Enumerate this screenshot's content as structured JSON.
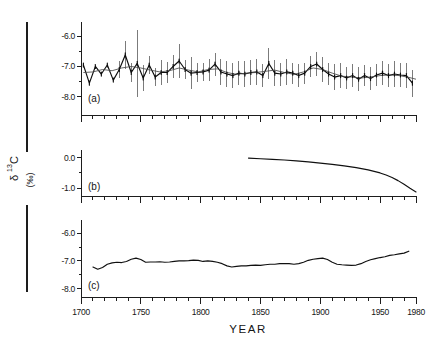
{
  "figure": {
    "y_axis_label": {
      "delta": "δ",
      "superscript": "13",
      "element": "C",
      "units": "(‰)"
    },
    "x_axis_title": "YEAR",
    "panels": [
      {
        "key": "a",
        "label": "(a)"
      },
      {
        "key": "b",
        "label": "(b)"
      },
      {
        "key": "c",
        "label": "(c)"
      }
    ]
  },
  "chart_data": [
    {
      "type": "line",
      "panel": "a",
      "title": "",
      "subtitle": "Measured tree-ring δ13C with 5-year means and error bars",
      "xlabel": "YEAR",
      "ylabel": "δ13C (‰)",
      "xlim": [
        1700,
        1980
      ],
      "ylim": [
        -8.6,
        -5.6
      ],
      "grid": false,
      "legend": "none",
      "xticks": [
        1700,
        1750,
        1800,
        1850,
        1900,
        1950,
        1980
      ],
      "xtick_labels": [
        "1700",
        "1750",
        "1800",
        "1850",
        "1900",
        "1950",
        "1980"
      ],
      "xminor_step": 10,
      "yticks": [
        -6.0,
        -7.0,
        -8.0
      ],
      "ytick_labels": [
        "-6.0",
        "-7.0",
        "-8.0"
      ],
      "yminor": [
        -6.5,
        -7.5
      ],
      "series": [
        {
          "name": "measured",
          "x": [
            1702,
            1707,
            1712,
            1717,
            1722,
            1727,
            1732,
            1737,
            1742,
            1747,
            1752,
            1757,
            1762,
            1767,
            1772,
            1777,
            1782,
            1787,
            1792,
            1797,
            1802,
            1807,
            1812,
            1817,
            1822,
            1827,
            1832,
            1837,
            1842,
            1847,
            1852,
            1857,
            1862,
            1867,
            1872,
            1877,
            1882,
            1887,
            1892,
            1897,
            1902,
            1907,
            1912,
            1917,
            1922,
            1927,
            1932,
            1937,
            1942,
            1947,
            1952,
            1957,
            1962,
            1967,
            1972,
            1977
          ],
          "values": [
            -6.95,
            -7.55,
            -7.0,
            -7.25,
            -6.95,
            -7.45,
            -7.1,
            -6.62,
            -7.2,
            -6.9,
            -7.38,
            -6.95,
            -7.35,
            -7.2,
            -7.2,
            -7.0,
            -6.82,
            -7.1,
            -7.22,
            -7.2,
            -7.18,
            -7.12,
            -6.92,
            -7.18,
            -7.25,
            -7.3,
            -7.22,
            -7.25,
            -7.2,
            -7.18,
            -7.3,
            -6.9,
            -7.22,
            -7.25,
            -7.18,
            -7.22,
            -7.3,
            -7.22,
            -7.0,
            -6.92,
            -7.1,
            -7.25,
            -7.35,
            -7.3,
            -7.38,
            -7.3,
            -7.42,
            -7.3,
            -7.4,
            -7.28,
            -7.22,
            -7.3,
            -7.25,
            -7.28,
            -7.3,
            -7.55
          ],
          "errors": [
            0.0,
            0.0,
            0.0,
            0.0,
            0.0,
            0.0,
            0.28,
            0.45,
            0.3,
            1.1,
            0.42,
            0.3,
            0.3,
            0.42,
            0.35,
            0.38,
            0.55,
            0.3,
            0.52,
            0.3,
            0.3,
            0.35,
            0.38,
            0.42,
            0.42,
            0.4,
            0.4,
            0.42,
            0.4,
            0.42,
            0.38,
            0.5,
            0.42,
            0.38,
            0.42,
            0.35,
            0.38,
            0.35,
            0.35,
            0.4,
            0.42,
            0.35,
            0.42,
            0.4,
            0.35,
            0.38,
            0.4,
            0.35,
            0.38,
            0.35,
            0.4,
            0.38,
            0.42,
            0.4,
            0.42,
            0.45
          ]
        },
        {
          "name": "smoothed",
          "x": [
            1702,
            1710,
            1718,
            1726,
            1734,
            1742,
            1750,
            1758,
            1766,
            1774,
            1782,
            1790,
            1798,
            1806,
            1814,
            1822,
            1830,
            1838,
            1846,
            1854,
            1862,
            1870,
            1878,
            1886,
            1894,
            1902,
            1910,
            1918,
            1926,
            1934,
            1942,
            1950,
            1958,
            1966,
            1974,
            1980
          ],
          "values": [
            -7.2,
            -7.18,
            -7.1,
            -7.14,
            -7.05,
            -7.0,
            -7.05,
            -7.12,
            -7.18,
            -7.14,
            -7.05,
            -7.12,
            -7.18,
            -7.1,
            -7.08,
            -7.2,
            -7.26,
            -7.22,
            -7.2,
            -7.16,
            -7.12,
            -7.2,
            -7.26,
            -7.18,
            -7.05,
            -7.1,
            -7.22,
            -7.32,
            -7.35,
            -7.38,
            -7.35,
            -7.3,
            -7.28,
            -7.3,
            -7.36,
            -7.42
          ]
        }
      ]
    },
    {
      "type": "line",
      "panel": "b",
      "title": "",
      "subtitle": "Suess effect correction (fossil fuel CO2 dilution)",
      "xlabel": "YEAR",
      "ylabel": "δ13C (‰)",
      "xlim": [
        1700,
        1980
      ],
      "ylim": [
        -1.25,
        0.18
      ],
      "grid": false,
      "legend": "none",
      "xticks": [
        1700,
        1750,
        1800,
        1850,
        1900,
        1950,
        1980
      ],
      "xtick_labels": [
        "1700",
        "1750",
        "1800",
        "1850",
        "1900",
        "1950",
        "1980"
      ],
      "xminor_step": 10,
      "yticks": [
        0.0,
        -1.0
      ],
      "ytick_labels": [
        "0.0",
        "-1.0"
      ],
      "yminor": [
        -0.5
      ],
      "series": [
        {
          "name": "suess-correction",
          "x": [
            1840,
            1850,
            1860,
            1870,
            1880,
            1890,
            1900,
            1910,
            1920,
            1930,
            1940,
            1950,
            1955,
            1960,
            1965,
            1970,
            1975,
            1980
          ],
          "values": [
            -0.02,
            -0.04,
            -0.06,
            -0.08,
            -0.11,
            -0.14,
            -0.18,
            -0.22,
            -0.27,
            -0.33,
            -0.4,
            -0.5,
            -0.57,
            -0.65,
            -0.75,
            -0.87,
            -1.0,
            -1.12
          ]
        }
      ]
    },
    {
      "type": "line",
      "panel": "c",
      "title": "",
      "subtitle": "Corrected δ13C record (measured minus Suess effect), smoothed",
      "xlabel": "YEAR",
      "ylabel": "δ13C (‰)",
      "xlim": [
        1700,
        1980
      ],
      "ylim": [
        -8.3,
        -5.6
      ],
      "grid": false,
      "legend": "none",
      "xticks": [
        1700,
        1750,
        1800,
        1850,
        1900,
        1950,
        1980
      ],
      "xtick_labels": [
        "1700",
        "1750",
        "1800",
        "1850",
        "1900",
        "1950",
        "1980"
      ],
      "xminor_step": 10,
      "yticks": [
        -6.0,
        -7.0,
        -8.0
      ],
      "ytick_labels": [
        "-6.0",
        "-7.0",
        "-8.0"
      ],
      "yminor": [
        -6.5,
        -7.5
      ],
      "series": [
        {
          "name": "corrected",
          "x": [
            1710,
            1714,
            1718,
            1722,
            1726,
            1730,
            1734,
            1738,
            1742,
            1746,
            1750,
            1754,
            1758,
            1762,
            1766,
            1770,
            1774,
            1778,
            1782,
            1786,
            1790,
            1794,
            1798,
            1802,
            1806,
            1810,
            1814,
            1818,
            1822,
            1826,
            1830,
            1834,
            1838,
            1842,
            1846,
            1850,
            1854,
            1858,
            1862,
            1866,
            1870,
            1874,
            1878,
            1882,
            1886,
            1890,
            1894,
            1898,
            1902,
            1906,
            1910,
            1914,
            1918,
            1922,
            1926,
            1930,
            1934,
            1938,
            1942,
            1946,
            1950,
            1954,
            1958,
            1962,
            1966,
            1970,
            1974
          ],
          "values": [
            -7.22,
            -7.3,
            -7.24,
            -7.12,
            -7.07,
            -7.05,
            -7.06,
            -7.02,
            -6.94,
            -6.9,
            -6.95,
            -7.05,
            -7.04,
            -7.04,
            -7.03,
            -7.05,
            -7.04,
            -7.02,
            -7.0,
            -7.0,
            -6.99,
            -6.97,
            -6.98,
            -7.02,
            -7.0,
            -7.02,
            -7.05,
            -7.1,
            -7.18,
            -7.22,
            -7.2,
            -7.18,
            -7.18,
            -7.16,
            -7.15,
            -7.16,
            -7.14,
            -7.12,
            -7.12,
            -7.1,
            -7.1,
            -7.1,
            -7.12,
            -7.1,
            -7.05,
            -6.98,
            -6.94,
            -6.92,
            -6.9,
            -6.95,
            -7.05,
            -7.12,
            -7.14,
            -7.15,
            -7.16,
            -7.15,
            -7.1,
            -7.02,
            -6.96,
            -6.92,
            -6.88,
            -6.85,
            -6.8,
            -6.78,
            -6.75,
            -6.72,
            -6.65
          ]
        }
      ]
    }
  ]
}
